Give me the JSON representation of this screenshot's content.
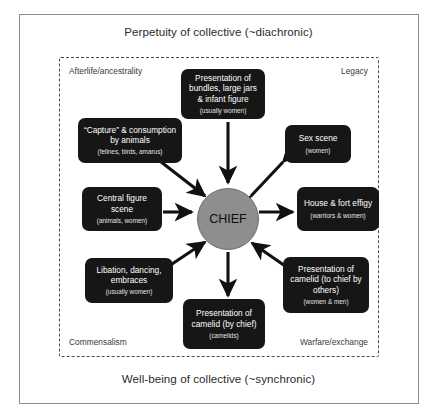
{
  "figure": {
    "axes": {
      "top_label": "Perpetuity of collective (~diachronic)",
      "bottom_label": "Well-being of collective (~synchronic)"
    },
    "corners": {
      "top_left": "Afterlife/ancestrality",
      "top_right": "Legacy",
      "bottom_left": "Commensalism",
      "bottom_right": "Warfare/exchange"
    },
    "center_node": {
      "label": "CHIEF",
      "fill": "#8e8e8e",
      "text_color": "#0d0d0d"
    },
    "node_fill": "#161616",
    "node_text_color": "#ffffff",
    "nodes": [
      {
        "id": "bundles",
        "title": "Presentation of bundles, large jars & infant figure",
        "sub": "(usually women)",
        "arrow": "to-chief"
      },
      {
        "id": "capture",
        "title": "“Capture” & consumption by animals",
        "sub": "(felines, birds, amarus)",
        "arrow": "to-chief"
      },
      {
        "id": "sex-scene",
        "title": "Sex scene",
        "sub": "(women)",
        "arrow": "bidirectional"
      },
      {
        "id": "central-figure",
        "title": "Central figure scene",
        "sub": "(animals, women)",
        "arrow": "to-chief"
      },
      {
        "id": "house-fort-effigy",
        "title": "House & fort effigy",
        "sub": "(warriors & women)",
        "arrow": "from-chief"
      },
      {
        "id": "libation",
        "title": "Libation, dancing, embraces",
        "sub": "(usually women)",
        "arrow": "to-chief"
      },
      {
        "id": "camelid-to-chief",
        "title": "Presentation of camelid (to chief by others)",
        "sub": "(women & men)",
        "arrow": "to-chief"
      },
      {
        "id": "camelid-by-chief",
        "title": "Presentation of camelid (by chief)",
        "sub": "(camelids)",
        "arrow": "from-chief"
      }
    ]
  }
}
